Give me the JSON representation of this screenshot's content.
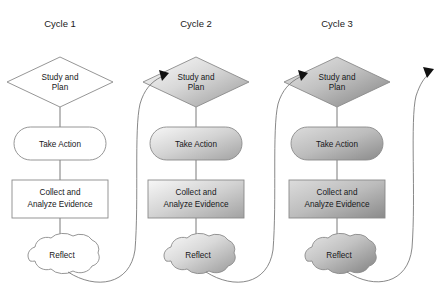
{
  "diagram": {
    "title_row": [
      {
        "label": "Cycle 1",
        "cx": 60
      },
      {
        "label": "Cycle 2",
        "cx": 196
      },
      {
        "label": "Cycle 3",
        "cx": 337
      }
    ],
    "node_labels": {
      "study_line1": "Study and",
      "study_line2": "Plan",
      "action": "Take Action",
      "collect_line1": "Collect and",
      "collect_line2": "Analyze Evidence",
      "reflect": "Reflect"
    },
    "colors": {
      "outline": "#8a8a8a",
      "connector": "#6b6b6b",
      "curve": "#7a7a7a",
      "arrowhead": "#111111",
      "text": "#17181a",
      "cycle1_fill": "#ffffff",
      "cycle2_fill_light": "#f2f2f2",
      "cycle2_fill_dark": "#9c9c9c",
      "cycle3_fill_light": "#e2e2e2",
      "cycle3_fill_dark": "#848484",
      "background": "#ffffff"
    },
    "cycles": [
      {
        "name": "Cycle 1",
        "cx": 60,
        "style": "plain"
      },
      {
        "name": "Cycle 2",
        "cx": 196,
        "style": "gradient-light"
      },
      {
        "name": "Cycle 3",
        "cx": 337,
        "style": "gradient-dark"
      }
    ],
    "flow_order": [
      "Study and Plan",
      "Take Action",
      "Collect and Analyze Evidence",
      "Reflect"
    ],
    "loop_arrows": [
      {
        "from": "Cycle 1 Reflect",
        "to": "Cycle 2 Study and Plan"
      },
      {
        "from": "Cycle 2 Reflect",
        "to": "Cycle 3 Study and Plan"
      },
      {
        "from": "Cycle 3 Reflect",
        "to": "next cycle (off diagram)"
      }
    ]
  }
}
